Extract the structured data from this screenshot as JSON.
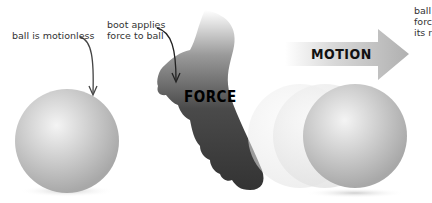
{
  "annotations": {
    "motionless": "ball is motionless",
    "boot_line1": "boot applies",
    "boot_line2": "force to ball",
    "right_line1": "ball",
    "right_line2": "forc",
    "right_line3": "its r"
  },
  "labels": {
    "force": "FORCE",
    "motion": "MOTION"
  },
  "colors": {
    "boot": "#3a3a3a",
    "ball": "#c8c8c8",
    "arrow": "#bdbdbd",
    "text": "#333333"
  }
}
